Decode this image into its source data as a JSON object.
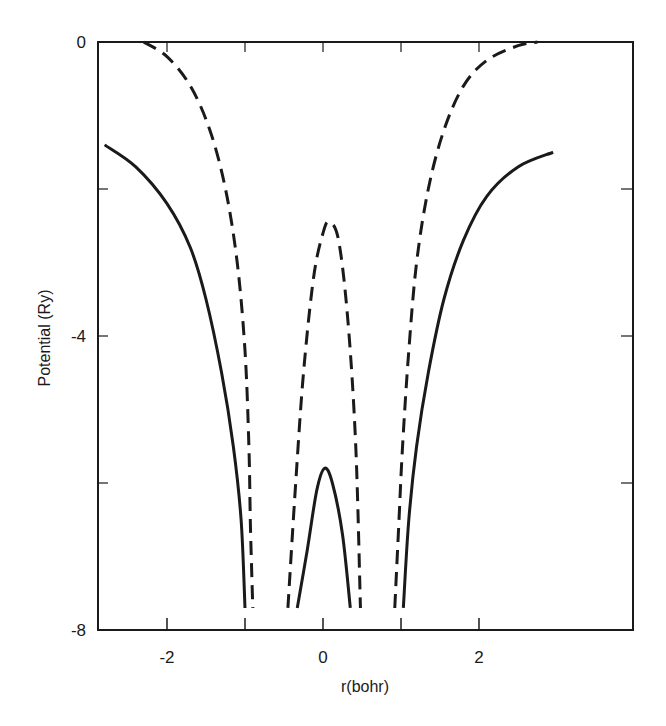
{
  "chart_data": {
    "type": "line",
    "title": "",
    "xlabel": "r(bohr)",
    "ylabel": "Potential (Ry)",
    "xlim": [
      -2.9,
      3.0
    ],
    "ylim": [
      -8,
      0
    ],
    "x_ticks": [
      -2,
      -1,
      0,
      1,
      2
    ],
    "x_tick_labels": [
      "-2",
      "",
      "0",
      "",
      "2"
    ],
    "y_ticks": [
      0,
      -2,
      -4,
      -6,
      -8
    ],
    "y_tick_labels": [
      "0",
      "",
      "-4",
      "",
      "-8"
    ],
    "grid": false,
    "legend": null,
    "series": [
      {
        "name": "solid-outer-left",
        "style": "solid",
        "points": [
          [
            -2.8,
            -1.4
          ],
          [
            -2.4,
            -1.7
          ],
          [
            -2.0,
            -2.2
          ],
          [
            -1.7,
            -2.8
          ],
          [
            -1.5,
            -3.5
          ],
          [
            -1.3,
            -4.5
          ],
          [
            -1.15,
            -5.5
          ],
          [
            -1.05,
            -6.5
          ],
          [
            -1.0,
            -7.7
          ]
        ]
      },
      {
        "name": "dashed-outer-left",
        "style": "dashed",
        "points": [
          [
            -2.3,
            0.0
          ],
          [
            -2.0,
            -0.2
          ],
          [
            -1.7,
            -0.6
          ],
          [
            -1.45,
            -1.2
          ],
          [
            -1.25,
            -2.0
          ],
          [
            -1.1,
            -3.0
          ],
          [
            -1.0,
            -4.2
          ],
          [
            -0.95,
            -5.5
          ],
          [
            -0.93,
            -6.6
          ],
          [
            -0.9,
            -7.7
          ]
        ]
      },
      {
        "name": "dashed-inner",
        "style": "dashed",
        "points": [
          [
            -0.45,
            -7.7
          ],
          [
            -0.35,
            -6.0
          ],
          [
            -0.25,
            -4.5
          ],
          [
            -0.12,
            -3.2
          ],
          [
            0.0,
            -2.6
          ],
          [
            0.08,
            -2.45
          ],
          [
            0.2,
            -2.7
          ],
          [
            0.32,
            -3.8
          ],
          [
            0.42,
            -5.5
          ],
          [
            0.48,
            -7.7
          ]
        ]
      },
      {
        "name": "solid-inner",
        "style": "solid",
        "points": [
          [
            -0.33,
            -7.7
          ],
          [
            -0.2,
            -6.9
          ],
          [
            -0.08,
            -6.1
          ],
          [
            0.02,
            -5.8
          ],
          [
            0.12,
            -6.0
          ],
          [
            0.25,
            -6.7
          ],
          [
            0.35,
            -7.7
          ]
        ]
      },
      {
        "name": "dashed-outer-right",
        "style": "dashed",
        "points": [
          [
            0.92,
            -7.7
          ],
          [
            0.97,
            -6.6
          ],
          [
            1.02,
            -5.5
          ],
          [
            1.1,
            -4.2
          ],
          [
            1.2,
            -3.0
          ],
          [
            1.35,
            -2.0
          ],
          [
            1.55,
            -1.2
          ],
          [
            1.8,
            -0.6
          ],
          [
            2.1,
            -0.25
          ],
          [
            2.5,
            -0.05
          ],
          [
            2.75,
            0.0
          ]
        ]
      },
      {
        "name": "solid-outer-right",
        "style": "solid",
        "points": [
          [
            1.03,
            -7.7
          ],
          [
            1.1,
            -6.5
          ],
          [
            1.2,
            -5.5
          ],
          [
            1.35,
            -4.5
          ],
          [
            1.55,
            -3.5
          ],
          [
            1.8,
            -2.7
          ],
          [
            2.1,
            -2.1
          ],
          [
            2.5,
            -1.7
          ],
          [
            2.95,
            -1.5
          ]
        ]
      }
    ]
  },
  "axes": {
    "x_label": "r(bohr)",
    "y_label": "Potential (Ry)"
  },
  "layout": {
    "plot_left": 98,
    "plot_right": 633,
    "plot_top": 42,
    "plot_bottom": 630,
    "x_zero_px": 323,
    "x_unit_px": 78,
    "y_zero_px": 42,
    "y_unit_px": 73.5,
    "line_color": "#1a1a1a"
  }
}
